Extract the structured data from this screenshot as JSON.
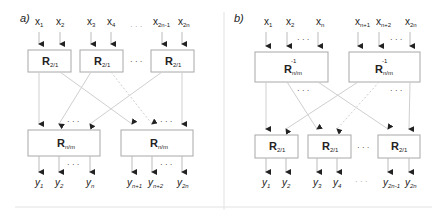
{
  "panel_a": {
    "label": "a)",
    "inputs": [
      "x",
      "x",
      "x",
      "x",
      "x",
      "x"
    ],
    "input_subs": [
      "1",
      "2",
      "3",
      "4",
      "2n-1",
      "2n"
    ],
    "input_ellipsis": "· · ·",
    "top_blocks": [
      {
        "main": "R",
        "sub": "2/1"
      },
      {
        "main": "R",
        "sub": "2/1"
      },
      {
        "main": "R",
        "sub": "2/1"
      }
    ],
    "block_ellipsis": "· · ·",
    "bottom_blocks": [
      {
        "main": "R",
        "sub": "n/m"
      },
      {
        "main": "R",
        "sub": "n/m"
      }
    ],
    "outputs": [
      "y",
      "y",
      "y",
      "y",
      "y",
      "y"
    ],
    "output_subs": [
      "1",
      "2",
      "n",
      "n+1",
      "n+2",
      "2n"
    ],
    "dots": "· · ·"
  },
  "panel_b": {
    "label": "b)",
    "inputs": [
      "x",
      "x",
      "x",
      "x",
      "x",
      "x"
    ],
    "input_subs": [
      "1",
      "2",
      "n",
      "n+1",
      "n+2",
      "2n"
    ],
    "top_blocks": [
      {
        "main": "R",
        "sup": "-1",
        "sub": "n/m"
      },
      {
        "main": "R",
        "sup": "-1",
        "sub": "n/m"
      }
    ],
    "bottom_blocks": [
      {
        "main": "R",
        "sub": "2/1"
      },
      {
        "main": "R",
        "sub": "2/1"
      },
      {
        "main": "R",
        "sub": "2/1"
      }
    ],
    "block_ellipsis": "· · ·",
    "outputs": [
      "y",
      "y",
      "y",
      "y",
      "y",
      "y"
    ],
    "output_subs": [
      "1",
      "2",
      "3",
      "4",
      "2n-1",
      "2n"
    ],
    "dots": "· · ·"
  },
  "colors": {
    "line": "#c8c8c8",
    "box": "#a8a8a8",
    "arrow": "#222222",
    "text": "#222222",
    "frame": "#e0e0e0"
  }
}
